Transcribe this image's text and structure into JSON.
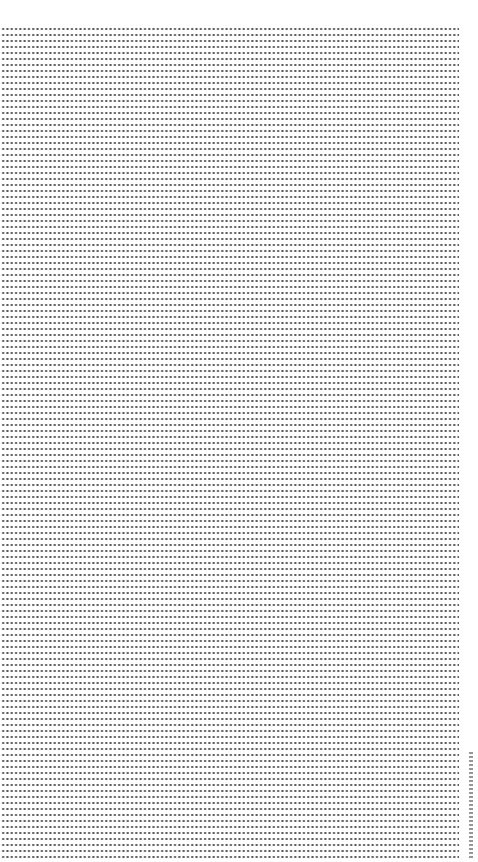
{
  "page": {
    "type": "dot-grid paper",
    "background_color": "#ffffff",
    "dot_color": "#3a3a3a",
    "grid": {
      "left_px": 1,
      "top_px": 26,
      "right_px": 459,
      "bottom_px": 862,
      "column_spacing_px": 4.3,
      "row_spacing_px": 6
    }
  },
  "margin_label": {
    "orientation": "vertical",
    "position": "bottom-right margin",
    "text": ""
  }
}
